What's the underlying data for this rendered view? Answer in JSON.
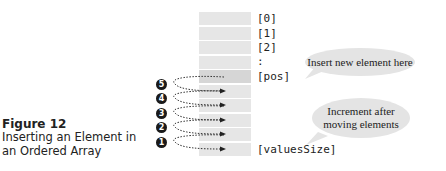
{
  "caption": {
    "figure_number": "Figure 12",
    "title_line1": "Inserting an Element in",
    "title_line2": "an Ordered Array"
  },
  "array": {
    "labels": [
      "[0]",
      "[1]",
      "[2]",
      ":",
      "[pos]",
      "[valuesSize]"
    ],
    "cell_count": 10,
    "highlight_row": "pos"
  },
  "callouts": {
    "insert": "Insert new element here",
    "increment_line1": "Increment after",
    "increment_line2": "moving elements"
  },
  "steps": [
    "5",
    "4",
    "3",
    "2",
    "1"
  ],
  "colors": {
    "cell": "#e6e6e6",
    "pos_cell": "#d6d6d6",
    "bubble": "#e4e4e4",
    "badge": "#1a1a1a"
  }
}
